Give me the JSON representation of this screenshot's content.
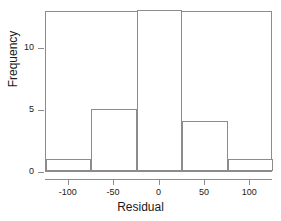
{
  "chart_data": {
    "type": "bar",
    "title": "",
    "subtitle": "",
    "xlabel": "Residual",
    "ylabel": "Frequency",
    "histogram": true,
    "bin_width": 50,
    "bin_edges": [
      -125,
      -75,
      -25,
      25,
      75,
      125
    ],
    "categories": [
      "-125 to -75",
      "-75 to -25",
      "-25 to 25",
      "25 to 75",
      "75 to 125"
    ],
    "bin_centers": [
      -100,
      -50,
      0,
      50,
      100
    ],
    "values": [
      1,
      5,
      13,
      4,
      1
    ],
    "xlim": [
      -125,
      125
    ],
    "ylim": [
      0,
      13
    ],
    "xticks": [
      -100,
      -50,
      0,
      50,
      100
    ],
    "xtick_labels": [
      "-100",
      "-50",
      "0",
      "50",
      "100"
    ],
    "yticks": [
      0,
      5,
      10
    ],
    "ytick_labels": [
      "0",
      "5",
      "10"
    ],
    "grid": false,
    "legend": null,
    "bar_fill_color": "#ffffff",
    "bar_edge_color": "#8c8c8c",
    "axis_color": "#8c8c8c",
    "background_color": "#ffffff",
    "text_color": "#1a1a1a"
  }
}
